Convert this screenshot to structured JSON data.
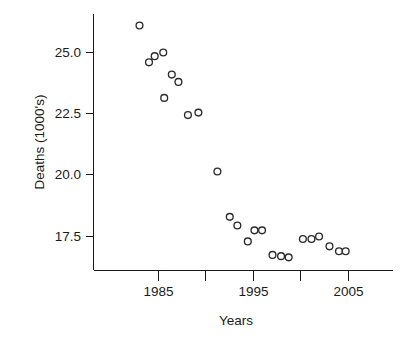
{
  "chart_data": {
    "type": "scatter",
    "title": "",
    "xlabel": "Years",
    "ylabel": "Deaths (1000's)",
    "xlim": [
      1982.0,
      2006.8
    ],
    "ylim": [
      16.2,
      26.6
    ],
    "grid": false,
    "legend": "none",
    "x_ticks": [
      1985,
      1990,
      1995,
      2000,
      2005
    ],
    "x_tick_labels": [
      "1985",
      "",
      "1995",
      "",
      "2005"
    ],
    "y_ticks": [
      17.5,
      20.0,
      22.5,
      25.0
    ],
    "y_tick_labels": [
      "17.5",
      "20.0",
      "22.5",
      "25.0"
    ],
    "marker": "open-circle",
    "marker_color": "#2b2b2b",
    "x": [
      1983,
      1984,
      1984.6,
      1985.5,
      1985.6,
      1986.4,
      1987.1,
      1988.1,
      1989.2,
      1991.2,
      1992.5,
      1993.3,
      1994.4,
      1995.1,
      1995.9,
      1997.0,
      1997.9,
      1998.7,
      2000.2,
      2001.1,
      2001.9,
      2003.0,
      2004.0,
      2004.7
    ],
    "y": [
      26.1,
      24.6,
      24.85,
      25.0,
      23.15,
      24.1,
      23.8,
      22.45,
      22.55,
      20.15,
      18.3,
      17.95,
      17.3,
      17.75,
      17.75,
      16.75,
      16.7,
      16.65,
      17.4,
      17.4,
      17.5,
      17.1,
      16.9,
      16.9
    ],
    "points": [
      {
        "x": 1983.0,
        "y": 26.1
      },
      {
        "x": 1984.0,
        "y": 24.6
      },
      {
        "x": 1984.6,
        "y": 24.85
      },
      {
        "x": 1985.5,
        "y": 25.0
      },
      {
        "x": 1985.6,
        "y": 23.15
      },
      {
        "x": 1986.4,
        "y": 24.1
      },
      {
        "x": 1987.1,
        "y": 23.8
      },
      {
        "x": 1988.1,
        "y": 22.45
      },
      {
        "x": 1989.2,
        "y": 22.55
      },
      {
        "x": 1991.2,
        "y": 20.15
      },
      {
        "x": 1992.5,
        "y": 18.3
      },
      {
        "x": 1993.3,
        "y": 17.95
      },
      {
        "x": 1994.4,
        "y": 17.3
      },
      {
        "x": 1995.1,
        "y": 17.75
      },
      {
        "x": 1995.9,
        "y": 17.75
      },
      {
        "x": 1997.0,
        "y": 16.75
      },
      {
        "x": 1997.9,
        "y": 16.7
      },
      {
        "x": 1998.7,
        "y": 16.65
      },
      {
        "x": 2000.2,
        "y": 17.4
      },
      {
        "x": 2001.1,
        "y": 17.4
      },
      {
        "x": 2001.9,
        "y": 17.5
      },
      {
        "x": 2003.0,
        "y": 17.1
      },
      {
        "x": 2004.0,
        "y": 16.9
      },
      {
        "x": 2004.7,
        "y": 16.9
      }
    ]
  },
  "figure": {
    "background": "#ffffff",
    "axis_color": "#1a1a1a"
  }
}
